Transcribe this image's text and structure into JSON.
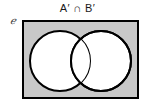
{
  "figure": {
    "title": "A′ ∩ B′",
    "universal_set_symbol": "ℯ",
    "set_a_label": "A",
    "set_b_label": "B"
  },
  "chart_data": {
    "type": "diagram",
    "diagram_kind": "venn",
    "title": "A′ ∩ B′",
    "expression": "A′ ∩ B′",
    "universal_set_symbol": "ℯ",
    "sets": [
      "A",
      "B"
    ],
    "shaded_regions": [
      "outside-A-and-outside-B"
    ],
    "unshaded_regions": [
      "A-only",
      "B-only",
      "A-intersect-B"
    ],
    "regions": [
      {
        "name": "universe-outside-both",
        "shaded": true,
        "fill": "#c8c8c8"
      },
      {
        "name": "A-only",
        "shaded": false,
        "fill": "#ffffff"
      },
      {
        "name": "A-intersect-B",
        "shaded": false,
        "fill": "#ffffff"
      },
      {
        "name": "B-only",
        "shaded": false,
        "fill": "#ffffff"
      }
    ],
    "colors": {
      "shading": "#c8c8c8",
      "unshaded": "#ffffff",
      "outline": "#000000",
      "background": "#ffffff",
      "title_text": "#1a1a1a",
      "label_text": "#3a3a3a"
    },
    "geometry": {
      "rectangle": {
        "x": 22,
        "y": 20,
        "width": 117,
        "height": 79,
        "stroke_width": 2
      },
      "circle_a": {
        "cx": 60,
        "cy": 61,
        "r": 30,
        "stroke_width": 2
      },
      "circle_b": {
        "cx": 101,
        "cy": 61,
        "r": 30,
        "stroke_width": 2
      }
    },
    "legend": "none",
    "grid": false
  }
}
